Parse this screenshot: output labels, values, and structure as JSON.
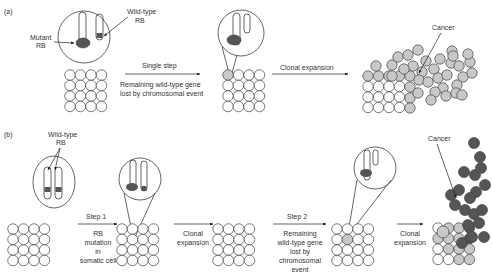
{
  "colors": {
    "white_cell": "#ffffff",
    "light_cell": "#c8c8c8",
    "dark_cell": "#555555",
    "mutant_blob": "#555555",
    "band": "#555555",
    "stroke": "#444444"
  },
  "panel_a": {
    "label": "(a)",
    "mutant_label_line1": "Mutant",
    "mutant_label_line2": "RB",
    "wildtype_label_line1": "Wild-type",
    "wildtype_label_line2": "RB",
    "arrow1_label": "Single step",
    "arrow1_caption_line1": "Remaining wild-type gene",
    "arrow1_caption_line2": "lost by chromosomal event",
    "arrow2_label": "Clonal expansion",
    "cancer_label": "Cancer"
  },
  "panel_b": {
    "label": "(b)",
    "wildtype_label_line1": "Wild-type",
    "wildtype_label_line2": "RB",
    "step1_label": "Step 1",
    "step1_caption": [
      "RB",
      "mutation",
      "in",
      "somatic cell"
    ],
    "clonal1_caption": [
      "Clonal",
      "expansion"
    ],
    "step2_label": "Step 2",
    "step2_caption": [
      "Remaining",
      "wild-type gene",
      "lost by",
      "chromosomal",
      "event"
    ],
    "clonal2_caption": [
      "Clonal",
      "expansion"
    ],
    "cancer_label": "Cancer"
  }
}
